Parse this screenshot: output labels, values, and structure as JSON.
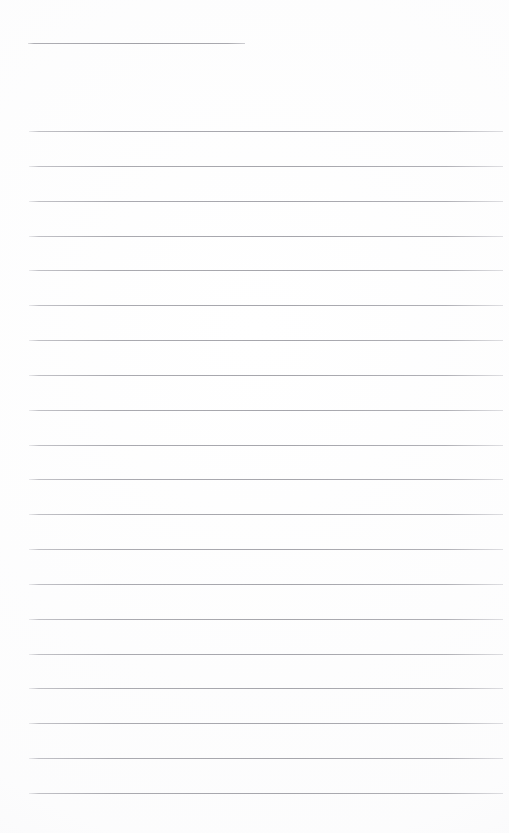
{
  "document": {
    "kind": "scanned-blank-ruled-page",
    "page_width": 509,
    "page_height": 833,
    "background_color": "#ffffff",
    "text_content": "",
    "has_visible_text": false
  },
  "rules": {
    "line_color": "#aaaab0",
    "line_thickness_px": 1,
    "header_rule": {
      "label": "header-rule",
      "x_start": 28,
      "x_end": 245,
      "y": 43,
      "width": 217
    },
    "body_lines": {
      "count": 20,
      "x_start": 29,
      "x_end": 503,
      "width": 474,
      "first_y": 131,
      "spacing": 34.85,
      "y_positions": [
        131,
        166,
        201,
        236,
        270,
        305,
        340,
        375,
        410,
        445,
        479,
        514,
        549,
        584,
        619,
        654,
        688,
        723,
        758,
        793
      ]
    }
  },
  "margins": {
    "top_blank_px": 43,
    "left_px": 28,
    "right_px": 6,
    "bottom_blank_px": 40,
    "header_gap_px": 88
  }
}
